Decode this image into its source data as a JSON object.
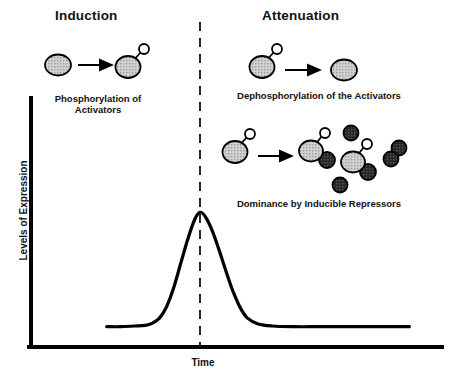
{
  "figure": {
    "headers": {
      "induction": "Induction",
      "attenuation": "Attenuation"
    },
    "captions": {
      "phosphorylation": "Phosphorylation of\nActivators",
      "dephosphorylation": "Dephosphorylation of the Activators",
      "dominance": "Dominance by Inducible Repressors"
    },
    "colors": {
      "line": "#000000",
      "activator_fill": "#c9c9c9",
      "repressor_fill": "#2b2b2b",
      "phosphate_fill": "#ffffff",
      "background": "#ffffff",
      "text": "#111111"
    }
  },
  "chart_data": {
    "type": "line",
    "title": "",
    "xlabel": "Time",
    "ylabel": "Levels of Expression",
    "xlim": [
      0,
      100
    ],
    "ylim": [
      0,
      100
    ],
    "grid": false,
    "legend": null,
    "annotations": [
      {
        "label": "Induction",
        "x": 18,
        "phase": "left-of-divider"
      },
      {
        "label": "Attenuation",
        "x": 72,
        "phase": "right-of-divider"
      },
      {
        "label": "divider",
        "type": "vertical-dashed-line",
        "x": 37.5
      }
    ],
    "series": [
      {
        "name": "Levels of Expression",
        "x": [
          11,
          15,
          19,
          22,
          24,
          26,
          28,
          30,
          32,
          34,
          36,
          37.5,
          39,
          41,
          43,
          45,
          47,
          49,
          51,
          54,
          58,
          64,
          72,
          80,
          90,
          97
        ],
        "values": [
          3,
          3,
          3.5,
          4,
          5.5,
          9,
          17,
          30,
          47,
          64,
          78,
          83,
          80,
          70,
          56,
          41,
          27,
          16,
          9,
          5,
          3.5,
          3,
          3,
          3,
          3,
          3
        ]
      }
    ]
  },
  "diagrams": {
    "induction_reaction": {
      "name": "phosphorylation-reaction",
      "reactant": "activator",
      "product": "phosphorylated-activator",
      "arrow": "right-arrow"
    },
    "dephosphorylation_reaction": {
      "name": "dephosphorylation-reaction",
      "reactant": "phosphorylated-activator",
      "product": "activator",
      "arrow": "right-arrow"
    },
    "repressor_reaction": {
      "name": "repressor-dominance-reaction",
      "reactant": "phosphorylated-activator",
      "products": "activator-repressor-complexes-and-free-repressors",
      "arrow": "right-arrow",
      "free_repressor_count": 2,
      "bound_complex_count": 2,
      "repressor_dimer_count": 1
    }
  }
}
